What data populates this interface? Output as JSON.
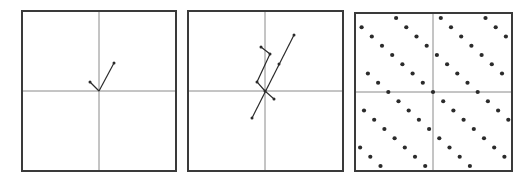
{
  "colors": {
    "frame": "#3a3a3a",
    "axis": "#8a8a8a",
    "ink": "#2b2b2b",
    "background": "#ffffff"
  },
  "panels": [
    {
      "id": "panel-1",
      "frame": {
        "x": 22,
        "y": 11,
        "w": 154,
        "h": 160
      },
      "origin": [
        99,
        91
      ],
      "vectors": [
        {
          "from": [
            99,
            91
          ],
          "to": [
            114,
            63
          ]
        },
        {
          "from": [
            99,
            91
          ],
          "to": [
            90,
            82
          ]
        }
      ]
    },
    {
      "id": "panel-2",
      "frame": {
        "x": 188,
        "y": 11,
        "w": 155,
        "h": 160
      },
      "origin": [
        265,
        91
      ],
      "lines": [
        {
          "points": [
            [
              252,
              118
            ],
            [
              294,
              35
            ]
          ],
          "mid_dot": [
            279,
            64
          ]
        },
        {
          "points": [
            [
              265,
              91
            ],
            [
              257,
              82
            ],
            [
              270,
              54
            ],
            [
              261,
              47
            ]
          ]
        },
        {
          "points": [
            [
              265,
              91
            ],
            [
              274,
              99
            ]
          ]
        }
      ]
    },
    {
      "id": "panel-3",
      "frame": {
        "x": 355,
        "y": 13,
        "w": 157,
        "h": 158
      },
      "origin": [
        433,
        92
      ],
      "lattice": {
        "u": [
          10.2,
          9.25
        ],
        "v": [
          44.7,
          0
        ],
        "dot_radius": 2.1
      }
    }
  ]
}
